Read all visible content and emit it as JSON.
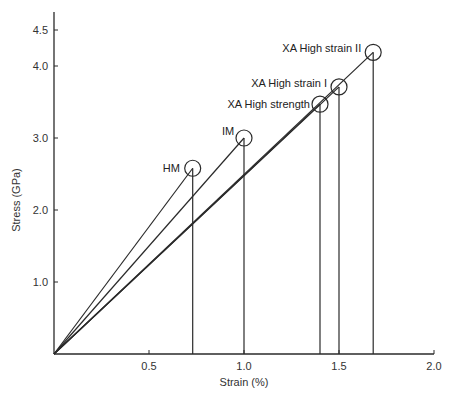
{
  "chart_data": {
    "type": "line",
    "title": "",
    "xlabel": "Strain   (%)",
    "ylabel": "Stress   (GPa)",
    "xlim": [
      0,
      2.0
    ],
    "ylim": [
      0,
      4.6
    ],
    "x_ticks": [
      0.5,
      1.0,
      1.5,
      2.0
    ],
    "x_tick_labels": [
      "0.5",
      "1.0",
      "1.5",
      "2.0"
    ],
    "y_ticks": [
      1.0,
      2.0,
      3.0,
      4.0,
      4.5
    ],
    "y_tick_labels": [
      "1.0",
      "2.0",
      "3.0",
      "4.0",
      "4.5"
    ],
    "grid": false,
    "legend": "none",
    "series": [
      {
        "name": "HM",
        "x": [
          0,
          0.73
        ],
        "y": [
          0,
          2.58
        ]
      },
      {
        "name": "IM",
        "x": [
          0,
          1.0
        ],
        "y": [
          0,
          3.0
        ]
      },
      {
        "name": "XA High strength",
        "x": [
          0,
          1.4
        ],
        "y": [
          0,
          3.47
        ]
      },
      {
        "name": "XA High strain I",
        "x": [
          0,
          1.5
        ],
        "y": [
          0,
          3.71
        ]
      },
      {
        "name": "XA High strain II",
        "x": [
          0,
          1.68
        ],
        "y": [
          0,
          4.19
        ]
      }
    ],
    "annotations": [
      "HM",
      "IM",
      "XA High strength",
      "XA High strain I",
      "XA High strain II"
    ]
  }
}
